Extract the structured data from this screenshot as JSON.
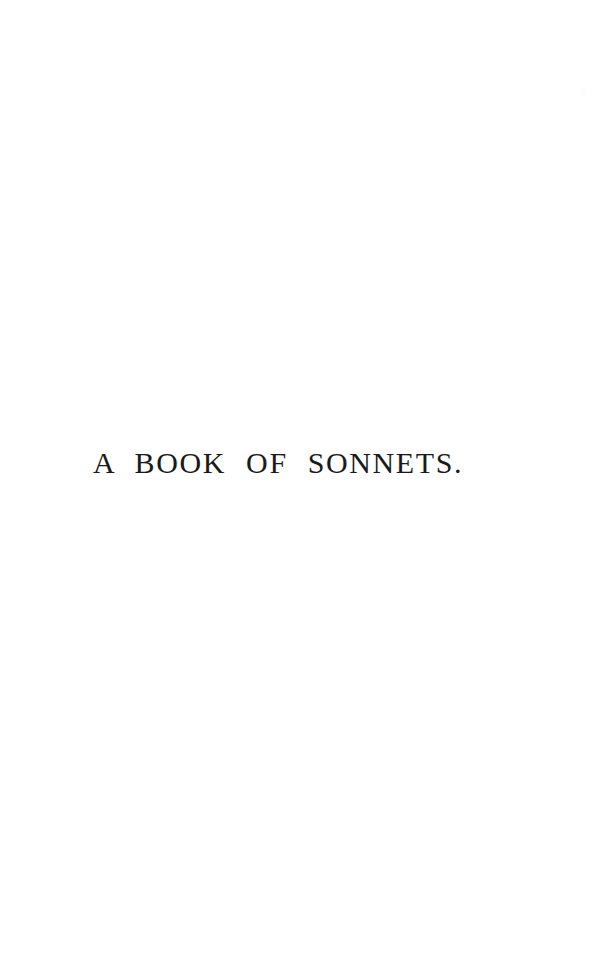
{
  "page": {
    "kind": "half-title-page",
    "background_color": "#ffffff",
    "width": 612,
    "height": 967
  },
  "content": {
    "half_title": "A BOOK OF SONNETS.",
    "ink_color": "#1a1a1a"
  },
  "artifacts": {
    "speck_color": "#fcfcfc"
  }
}
